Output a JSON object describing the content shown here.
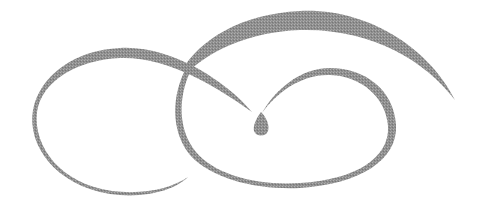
{
  "image": {
    "description": "decorative calligraphic flourish with interlocking loops",
    "background": "#ffffff",
    "stroke_color": "#8c8c8c"
  }
}
